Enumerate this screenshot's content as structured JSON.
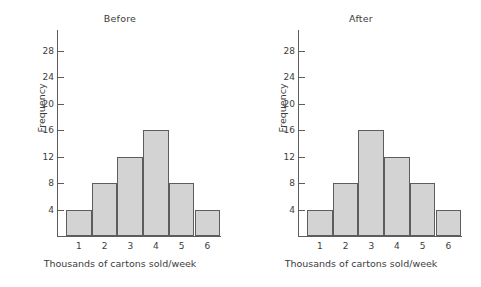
{
  "figure": {
    "background": "#ffffff",
    "bar_fill": "#d3d3d3",
    "bar_edge": "#5d5d5d",
    "axis_color": "#5d5d5d"
  },
  "chart_data": [
    {
      "type": "bar",
      "title": "Before",
      "xlabel": "Thousands of cartons sold/week",
      "ylabel": "Frequency",
      "categories": [
        "1",
        "2",
        "3",
        "4",
        "5",
        "6"
      ],
      "values": [
        4,
        8,
        12,
        16,
        8,
        4
      ],
      "yticks": [
        4,
        8,
        12,
        16,
        20,
        24,
        28
      ],
      "ytick_labels": [
        "4",
        "8",
        "12",
        "16",
        "20",
        "24",
        "28"
      ],
      "ylim": [
        0,
        31
      ],
      "xlim": [
        0.5,
        6.5
      ],
      "grid": false,
      "legend": false
    },
    {
      "type": "bar",
      "title": "After",
      "xlabel": "Thousands of cartons sold/week",
      "ylabel": "Frequency",
      "categories": [
        "1",
        "2",
        "3",
        "4",
        "5",
        "6"
      ],
      "values": [
        4,
        8,
        16,
        12,
        8,
        4
      ],
      "yticks": [
        4,
        8,
        12,
        16,
        20,
        24,
        28
      ],
      "ytick_labels": [
        "4",
        "8",
        "12",
        "16",
        "20",
        "24",
        "28"
      ],
      "ylim": [
        0,
        31
      ],
      "xlim": [
        0.5,
        6.5
      ],
      "grid": false,
      "legend": false
    }
  ]
}
